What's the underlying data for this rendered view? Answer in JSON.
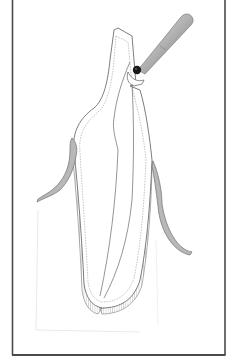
{
  "figure": {
    "colors": {
      "background": "#ffffff",
      "border": "#4a4a4a",
      "outline": "#6e6e6e",
      "gingiva": "#8a8a8a",
      "ligament": "#7a7a7a",
      "instrument_light": "#d8d8d8",
      "instrument_dark": "#7c7c7c",
      "instrument_tip": "#1a1a1a"
    }
  }
}
